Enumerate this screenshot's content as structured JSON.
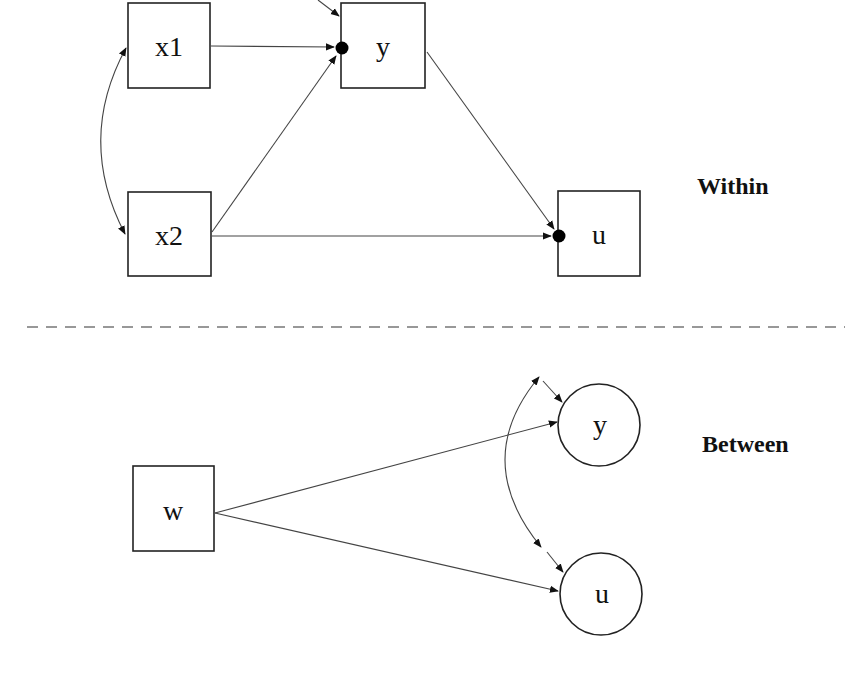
{
  "diagram": {
    "type": "multilevel-path-model",
    "levels": {
      "within": {
        "label": "Within",
        "nodes": [
          {
            "id": "x1",
            "label": "x1",
            "shape": "rect"
          },
          {
            "id": "x2",
            "label": "x2",
            "shape": "rect"
          },
          {
            "id": "y",
            "label": "y",
            "shape": "rect",
            "random_intercept_dot": true
          },
          {
            "id": "u",
            "label": "u",
            "shape": "rect",
            "random_intercept_dot": true
          }
        ],
        "edges": [
          {
            "from": "x1",
            "to": "y",
            "type": "directed"
          },
          {
            "from": "x2",
            "to": "y",
            "type": "directed"
          },
          {
            "from": "x2",
            "to": "u",
            "type": "directed"
          },
          {
            "from": "y",
            "to": "u",
            "type": "directed"
          },
          {
            "from": "x1",
            "to": "x2",
            "type": "covariance"
          },
          {
            "from": "residual",
            "to": "y",
            "type": "residual"
          }
        ]
      },
      "between": {
        "label": "Between",
        "nodes": [
          {
            "id": "w",
            "label": "w",
            "shape": "rect"
          },
          {
            "id": "y_b",
            "label": "y",
            "shape": "circle"
          },
          {
            "id": "u_b",
            "label": "u",
            "shape": "circle"
          }
        ],
        "edges": [
          {
            "from": "w",
            "to": "y_b",
            "type": "directed"
          },
          {
            "from": "w",
            "to": "u_b",
            "type": "directed"
          },
          {
            "from": "y_b",
            "to": "u_b",
            "type": "covariance"
          },
          {
            "from": "residual",
            "to": "y_b",
            "type": "residual"
          },
          {
            "from": "residual",
            "to": "u_b",
            "type": "residual"
          }
        ]
      }
    }
  },
  "colors": {
    "stroke": "#222222",
    "edge": "#444444",
    "divider": "#777777",
    "background": "#ffffff"
  }
}
